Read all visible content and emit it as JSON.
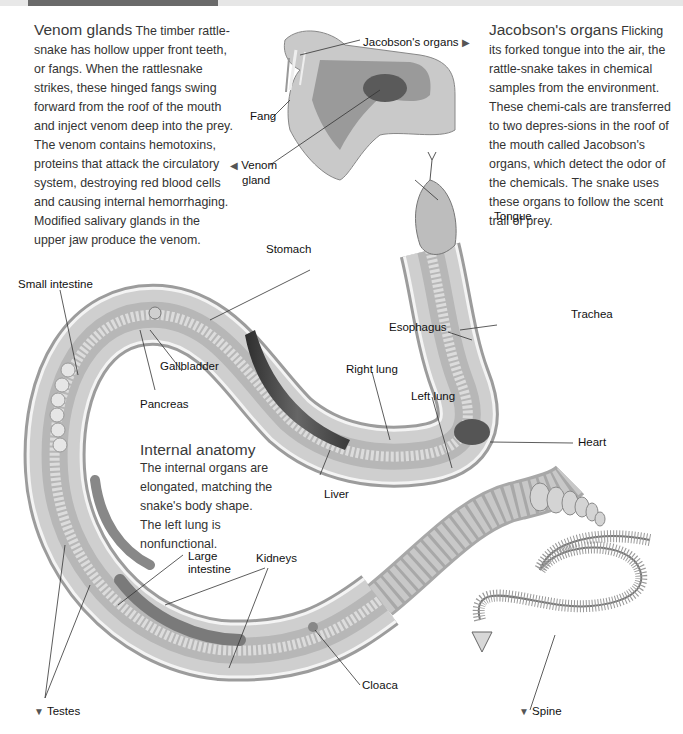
{
  "sections": {
    "venom": {
      "title": "Venom glands",
      "body": "The timber rattle-snake has hollow upper front teeth, or fangs. When the rattlesnake strikes, these hinged fangs swing forward from the roof of the mouth and inject venom deep into the prey. The venom contains hemotoxins, proteins that attack the circulatory system, destroying red blood cells and causing internal hemorrhaging. Modified salivary glands in the upper jaw produce the venom."
    },
    "jacobson": {
      "title": "Jacobson's organs",
      "body": "Flicking its forked tongue into the air, the rattle-snake takes in chemical samples from the environment. These chemi-cals are transferred to two depres-sions in the roof of the mouth called Jacobson's organs, which detect the odor of the chemicals. The snake uses these organs to follow the scent trail of prey."
    },
    "internal": {
      "title": "Internal anatomy",
      "body": "The internal organs are elongated, matching the snake's body shape. The left lung is nonfunctional."
    }
  },
  "labels": {
    "jacobsons_organs": "Jacobson's organs",
    "fang": "Fang",
    "venom_gland_1": "Venom",
    "venom_gland_2": "gland",
    "tongue": "Tongue",
    "stomach": "Stomach",
    "small_intestine": "Small intestine",
    "gallbladder": "Gallbladder",
    "pancreas": "Pancreas",
    "trachea": "Trachea",
    "esophagus": "Esophagus",
    "right_lung": "Right lung",
    "left_lung": "Left lung",
    "heart": "Heart",
    "liver": "Liver",
    "large_intestine_1": "Large",
    "large_intestine_2": "intestine",
    "kidneys": "Kidneys",
    "cloaca": "Cloaca",
    "testes": "Testes",
    "spine": "Spine"
  },
  "markers": {
    "right": "▶",
    "left": "◀",
    "down": "▼"
  },
  "colors": {
    "body_outer": "#d2d2d2",
    "body_inner": "#bdbdbd",
    "organ_dark": "#4a4a4a",
    "text": "#333333"
  }
}
